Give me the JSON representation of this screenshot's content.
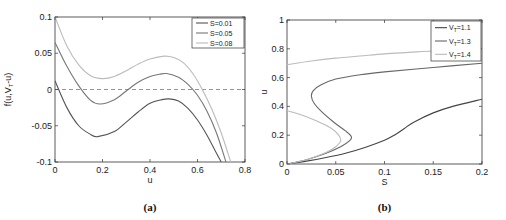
{
  "chart_data": [
    {
      "type": "line",
      "caption": "(a)",
      "title": "",
      "xlabel": "u",
      "ylabel": "f(u,V_T-u)",
      "xlim": [
        0,
        0.8
      ],
      "ylim": [
        -0.1,
        0.1
      ],
      "xticks": [
        0,
        0.2,
        0.4,
        0.6,
        0.8
      ],
      "xtick_labels": [
        "0",
        "0.2",
        "0.4",
        "0.6",
        "0.8"
      ],
      "yticks": [
        -0.1,
        -0.05,
        0,
        0.05,
        0.1
      ],
      "ytick_labels": [
        "-0.1",
        "-0.05",
        "0",
        "0.05",
        "0.1"
      ],
      "grid": false,
      "legend_position": "upper right",
      "reference_line": {
        "y": 0,
        "style": "dashed",
        "color": "#7a7a7a"
      },
      "series": [
        {
          "name": "S=0.01",
          "color": "#555555",
          "x": [
            0,
            0.05,
            0.1,
            0.15,
            0.18,
            0.25,
            0.3,
            0.35,
            0.4,
            0.45,
            0.48,
            0.52,
            0.56,
            0.6,
            0.64,
            0.68,
            0.7
          ],
          "y": [
            0.012,
            -0.025,
            -0.05,
            -0.062,
            -0.065,
            -0.058,
            -0.045,
            -0.031,
            -0.019,
            -0.014,
            -0.013,
            -0.016,
            -0.026,
            -0.042,
            -0.063,
            -0.088,
            -0.1
          ]
        },
        {
          "name": "S=0.05",
          "color": "#777777",
          "x": [
            0,
            0.05,
            0.1,
            0.15,
            0.19,
            0.25,
            0.3,
            0.35,
            0.4,
            0.44,
            0.47,
            0.52,
            0.56,
            0.6,
            0.64,
            0.68,
            0.72
          ],
          "y": [
            0.065,
            0.032,
            0.005,
            -0.015,
            -0.02,
            -0.014,
            -0.002,
            0.01,
            0.018,
            0.021,
            0.022,
            0.017,
            0.007,
            -0.008,
            -0.03,
            -0.06,
            -0.1
          ]
        },
        {
          "name": "S=0.08",
          "color": "#bbbbbb",
          "x": [
            0,
            0.05,
            0.1,
            0.15,
            0.2,
            0.25,
            0.3,
            0.35,
            0.4,
            0.46,
            0.5,
            0.54,
            0.58,
            0.62,
            0.66,
            0.7,
            0.74
          ],
          "y": [
            0.1,
            0.06,
            0.034,
            0.019,
            0.015,
            0.018,
            0.026,
            0.035,
            0.042,
            0.046,
            0.044,
            0.037,
            0.022,
            0.0,
            -0.027,
            -0.06,
            -0.1
          ]
        }
      ]
    },
    {
      "type": "line",
      "caption": "(b)",
      "title": "",
      "xlabel": "S",
      "ylabel": "u",
      "xlim": [
        0,
        0.2
      ],
      "ylim": [
        0,
        1
      ],
      "xticks": [
        0,
        0.05,
        0.1,
        0.15,
        0.2
      ],
      "xtick_labels": [
        "0",
        "0.05",
        "0.1",
        "0.15",
        "0.2"
      ],
      "yticks": [
        0,
        0.2,
        0.4,
        0.6,
        0.8,
        1
      ],
      "ytick_labels": [
        "0",
        "0.2",
        "0.4",
        "0.6",
        "0.8",
        "1"
      ],
      "grid": false,
      "legend_position": "upper right",
      "series": [
        {
          "name": "V_T=1.1",
          "legend_label": "V",
          "legend_sub": "T",
          "legend_suffix": "=1.1",
          "color": "#444444",
          "x": [
            0,
            0.02,
            0.04,
            0.06,
            0.08,
            0.1,
            0.11,
            0.12,
            0.13,
            0.15,
            0.17,
            0.2
          ],
          "y": [
            0,
            0.02,
            0.045,
            0.075,
            0.115,
            0.165,
            0.2,
            0.245,
            0.29,
            0.355,
            0.4,
            0.45
          ]
        },
        {
          "name": "V_T=1.3",
          "legend_label": "V",
          "legend_sub": "T",
          "legend_suffix": "=1.3",
          "color": "#666666",
          "x": [
            0,
            0.02,
            0.04,
            0.055,
            0.064,
            0.066,
            0.06,
            0.048,
            0.036,
            0.028,
            0.025,
            0.027,
            0.035,
            0.05,
            0.075,
            0.1,
            0.15,
            0.2
          ],
          "y": [
            0,
            0.03,
            0.075,
            0.12,
            0.16,
            0.19,
            0.23,
            0.29,
            0.36,
            0.42,
            0.47,
            0.51,
            0.55,
            0.59,
            0.62,
            0.64,
            0.67,
            0.7
          ]
        },
        {
          "name": "V_T=1.4 (lower branch)",
          "legend_label": "V",
          "legend_sub": "T",
          "legend_suffix": "=1.4",
          "color": "#bbbbbb",
          "x": [
            0,
            0.02,
            0.04,
            0.05,
            0.055,
            0.053,
            0.045,
            0.03,
            0.015,
            0
          ],
          "y": [
            0,
            0.03,
            0.08,
            0.12,
            0.16,
            0.2,
            0.25,
            0.3,
            0.34,
            0.37
          ]
        },
        {
          "name": "V_T=1.4 (upper branch)",
          "color": "#bbbbbb",
          "x": [
            0,
            0.025,
            0.05,
            0.075,
            0.1,
            0.125,
            0.15,
            0.175,
            0.2
          ],
          "y": [
            0.69,
            0.715,
            0.735,
            0.75,
            0.765,
            0.775,
            0.785,
            0.79,
            0.8
          ]
        }
      ]
    }
  ]
}
